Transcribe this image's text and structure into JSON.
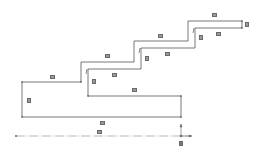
{
  "diagram": {
    "type": "stepped-profile",
    "stroke_color": "#555555",
    "axis_color": "#777777",
    "label_color": "#9a9a9a",
    "dimension_labels": [
      {
        "id": "top-step-width",
        "text": "▭"
      },
      {
        "id": "top-step-height",
        "text": "▯"
      },
      {
        "id": "top-step-inner-width",
        "text": "▭"
      },
      {
        "id": "top-step-inner-notch",
        "text": "▯"
      },
      {
        "id": "third-step-width",
        "text": "▭"
      },
      {
        "id": "third-step-inner-width",
        "text": "▭"
      },
      {
        "id": "third-step-inner-notch",
        "text": "▯"
      },
      {
        "id": "second-step-width",
        "text": "▭"
      },
      {
        "id": "second-step-inner-width",
        "text": "▭"
      },
      {
        "id": "second-step-inner-notch",
        "text": "▯"
      },
      {
        "id": "first-step-width",
        "text": "▭"
      },
      {
        "id": "first-step-height",
        "text": "▯"
      },
      {
        "id": "base-inner-width",
        "text": "▭"
      },
      {
        "id": "base-overall-width",
        "text": "▭"
      },
      {
        "id": "centerline-length",
        "text": "▭"
      },
      {
        "id": "origin-marker",
        "text": "▣"
      }
    ],
    "axis": {
      "centerline": "dash-dot",
      "origin_arrows": [
        "up",
        "right"
      ]
    }
  }
}
